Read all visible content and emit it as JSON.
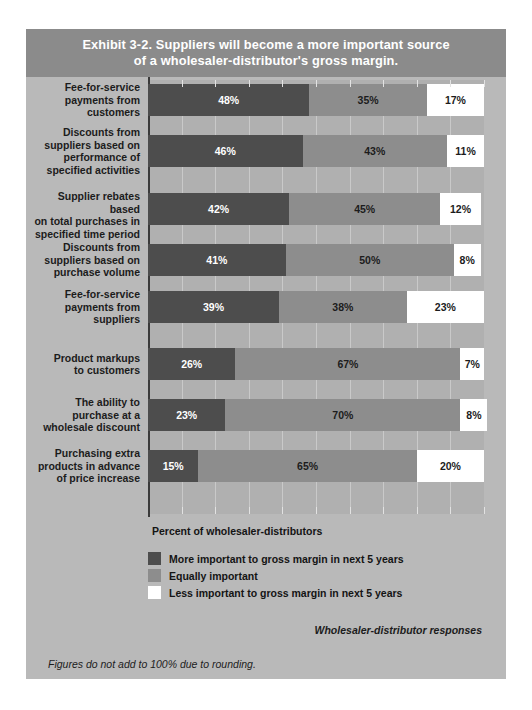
{
  "exhibit": {
    "title_line1": "Exhibit 3-2. Suppliers will become a more important source",
    "title_line2": "of a wholesaler-distributor's gross margin."
  },
  "axis_caption": "Percent of wholesaler-distributors",
  "source_note": "Wholesaler-distributor responses",
  "footnote": "Figures do not add to 100% due to rounding.",
  "colors": {
    "more_important": "#4d4d4d",
    "equally_important": "#8d8d8d",
    "less_important": "#ffffff",
    "title_band": "#8b8b8b",
    "card_background": "#b9b9b9",
    "plot_background": "#b0b0b0",
    "gridline": "#c9c9c9"
  },
  "legend": [
    {
      "label": "More important to gross margin in next 5 years",
      "swatch": "#4d4d4d",
      "key": "more"
    },
    {
      "label": "Equally important",
      "swatch": "#8d8d8d",
      "key": "equal"
    },
    {
      "label": "Less important to gross margin in next 5 years",
      "swatch": "#ffffff",
      "key": "less"
    }
  ],
  "chart_data": {
    "type": "bar",
    "orientation": "horizontal",
    "stacked": true,
    "title": "Exhibit 3-2. Suppliers will become a more important source of a wholesaler-distributor's gross margin.",
    "xlabel": "Percent of wholesaler-distributors",
    "ylabel": "",
    "xlim": [
      0,
      100
    ],
    "xticks": [
      0,
      10,
      20,
      30,
      40,
      50,
      60,
      70,
      80,
      90,
      100
    ],
    "grid": true,
    "legend_position": "bottom-left",
    "categories": [
      "Fee-for-service payments from customers",
      "Discounts from suppliers based on performance of specified activities",
      "Supplier rebates based on total purchases in specified time period",
      "Discounts from suppliers based on purchase volume",
      "Fee-for-service payments from suppliers",
      "Product markups to customers",
      "The ability to purchase at a wholesale discount",
      "Purchasing extra products in advance of price increase"
    ],
    "category_lines": [
      [
        "Fee-for-service",
        "payments from",
        "customers"
      ],
      [
        "Discounts from",
        "suppliers based on",
        "performance of",
        "specified activities"
      ],
      [
        "Supplier rebates based",
        "on total purchases in",
        "specified time period"
      ],
      [
        "Discounts from",
        "suppliers based on",
        "purchase volume"
      ],
      [
        "Fee-for-service",
        "payments from",
        "suppliers"
      ],
      [
        "Product markups",
        "to customers"
      ],
      [
        "The ability to",
        "purchase at a",
        "wholesale discount"
      ],
      [
        "Purchasing extra",
        "products in advance",
        "of price increase"
      ]
    ],
    "series": [
      {
        "name": "More important to gross margin in next 5 years",
        "values": [
          48,
          46,
          42,
          41,
          39,
          26,
          23,
          15
        ]
      },
      {
        "name": "Equally important",
        "values": [
          35,
          43,
          45,
          50,
          38,
          67,
          70,
          65
        ]
      },
      {
        "name": "Less important to gross margin in next 5 years",
        "values": [
          17,
          11,
          12,
          8,
          23,
          7,
          8,
          20
        ]
      }
    ],
    "labels": [
      {
        "more": "48%",
        "equal": "35%",
        "less": "17%"
      },
      {
        "more": "46%",
        "equal": "43%",
        "less": "11%"
      },
      {
        "more": "42%",
        "equal": "45%",
        "less": "12%"
      },
      {
        "more": "41%",
        "equal": "50%",
        "less": "8%"
      },
      {
        "more": "39%",
        "equal": "38%",
        "less": "23%"
      },
      {
        "more": "26%",
        "equal": "67%",
        "less": "7%"
      },
      {
        "more": "23%",
        "equal": "70%",
        "less": "8%"
      },
      {
        "more": "15%",
        "equal": "65%",
        "less": "20%"
      }
    ]
  }
}
